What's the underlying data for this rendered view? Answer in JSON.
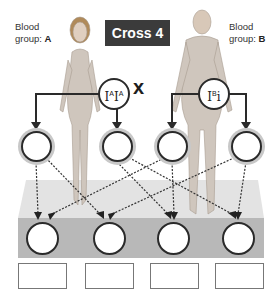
{
  "title": "Cross 4",
  "parents": {
    "female": {
      "label_prefix": "Blood",
      "label_line2": "group: ",
      "group": "A",
      "allele1": "I",
      "allele1_sup": "A",
      "allele2": "I",
      "allele2_sup": "A"
    },
    "male": {
      "label_prefix": "Blood",
      "label_line2": "group: ",
      "group": "B",
      "allele1": "I",
      "allele1_sup": "B",
      "allele2": "i",
      "allele2_sup": ""
    }
  },
  "cross_symbol": "x",
  "gametes": [
    "",
    "",
    "",
    ""
  ],
  "offspring": [
    "",
    "",
    "",
    ""
  ],
  "answer_boxes": [
    "",
    "",
    "",
    ""
  ],
  "colors": {
    "title_bg": "#3b3b3b",
    "platform_top": "#e2e2e2",
    "platform_front": "#b8b8b8",
    "line": "#2a2a2a"
  }
}
